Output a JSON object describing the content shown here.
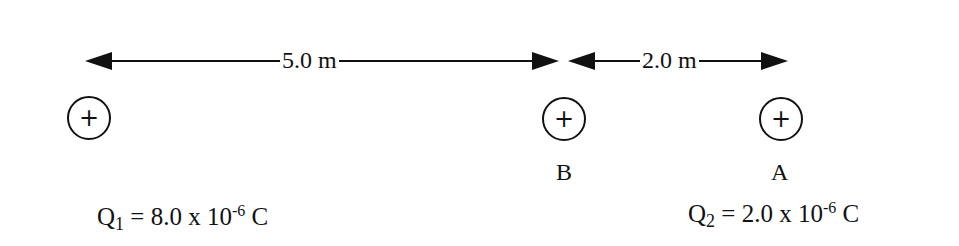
{
  "diagram": {
    "distances": [
      {
        "label": "5.0 m",
        "from": "Q1",
        "to": "B"
      },
      {
        "label": "2.0 m",
        "from": "B",
        "to": "A"
      }
    ],
    "charges": [
      {
        "id": "Q1",
        "symbol": "+",
        "name": "Q",
        "subscript": "1",
        "equation": " = 8.0 x 10",
        "exponent": "-6",
        "unit": " C"
      },
      {
        "id": "Q2",
        "symbol": "+",
        "name": "Q",
        "subscript": "2",
        "equation": " = 2.0 x 10",
        "exponent": "-6",
        "unit": " C"
      }
    ],
    "points": [
      {
        "id": "B",
        "symbol": "+",
        "label": "B"
      },
      {
        "id": "A",
        "symbol": "+",
        "label": "A"
      }
    ],
    "colors": {
      "ink": "#111111",
      "background": "#ffffff"
    }
  }
}
